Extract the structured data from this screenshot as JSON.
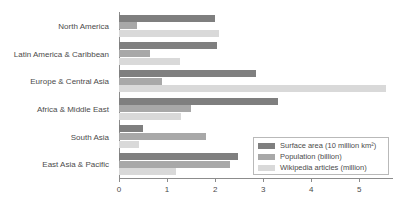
{
  "chart_data": {
    "type": "bar",
    "orientation": "horizontal",
    "title": "",
    "xlabel": "",
    "ylabel": "",
    "xlim": [
      0,
      5.7
    ],
    "xticks": [
      "0",
      "1",
      "2",
      "3",
      "4",
      "5"
    ],
    "xtick_values": [
      0,
      1,
      2,
      3,
      4,
      5
    ],
    "grid": false,
    "legend_position": "lower-right",
    "categories": [
      "North America",
      "Latin America & Caribbean",
      "Europe & Central Asia",
      "Africa & Middle East",
      "South Asia",
      "East Asia & Pacific"
    ],
    "series": [
      {
        "name": "Surface area (10 million km²)",
        "color": "#7f7f7f",
        "values": [
          1.99,
          2.04,
          2.85,
          3.3,
          0.5,
          2.47
        ]
      },
      {
        "name": "Population (billion)",
        "color": "#a8a8a8",
        "values": [
          0.37,
          0.65,
          0.9,
          1.5,
          1.81,
          2.3
        ]
      },
      {
        "name": "Wikipedia articles (million)",
        "color": "#d9d9d9",
        "values": [
          2.09,
          1.27,
          5.55,
          1.3,
          0.42,
          1.19
        ]
      }
    ]
  },
  "legend": {
    "items": [
      {
        "label": "Surface area (10 million km²)"
      },
      {
        "label": "Population (billion)"
      },
      {
        "label": "Wikipedia articles (million)"
      }
    ]
  },
  "colors": {
    "series_1": "#7f7f7f",
    "series_2": "#a8a8a8",
    "series_3": "#d9d9d9",
    "axis": "#8c8c8c",
    "text": "#4b4b4b",
    "background": "#ffffff"
  }
}
